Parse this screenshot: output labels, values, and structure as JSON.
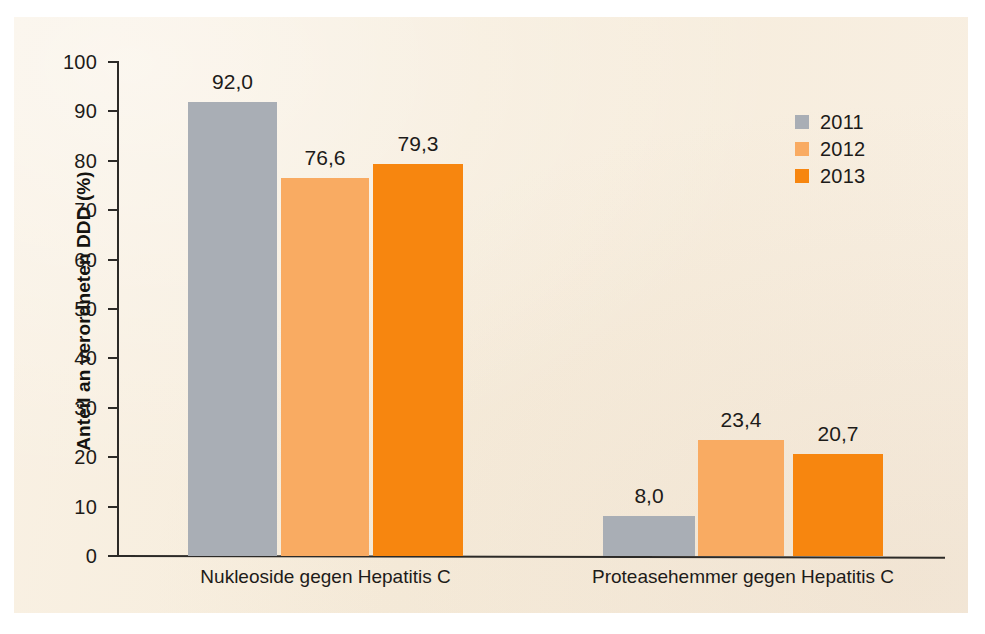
{
  "chart_data": {
    "type": "bar",
    "title": "",
    "xlabel": "",
    "ylabel": "Anteil an verordneten DDD (%)",
    "ylim": [
      0,
      100
    ],
    "ytick_step": 10,
    "yticks": [
      "100",
      "90",
      "80",
      "70",
      "60",
      "50",
      "40",
      "30",
      "20",
      "10",
      "0"
    ],
    "grid": false,
    "legend_position": "top-right",
    "categories": [
      "Nukleoside gegen Hepatitis C",
      "Proteasehemmer gegen Hepatitis C"
    ],
    "series": [
      {
        "name": "2011",
        "color": "#a9aeb5",
        "values": [
          92.0,
          8.0
        ],
        "labels": [
          "92,0",
          "8,0"
        ]
      },
      {
        "name": "2012",
        "color": "#f9ab62",
        "values": [
          76.6,
          23.4
        ],
        "labels": [
          "76,6",
          "23,4"
        ]
      },
      {
        "name": "2013",
        "color": "#f7860f",
        "values": [
          79.3,
          20.7
        ],
        "labels": [
          "79,3",
          "20,7"
        ]
      }
    ]
  },
  "legend": {
    "items": [
      {
        "label": "2011",
        "color": "#a9aeb5"
      },
      {
        "label": "2012",
        "color": "#f9ab62"
      },
      {
        "label": "2013",
        "color": "#f7860f"
      }
    ]
  },
  "axis": {
    "y_title": "Anteil an verordneten DDD (%)",
    "y_labels": [
      "100",
      "90",
      "80",
      "70",
      "60",
      "50",
      "40",
      "30",
      "20",
      "10",
      "0"
    ],
    "x_labels": [
      "Nukleoside gegen Hepatitis C",
      "Proteasehemmer gegen Hepatitis C"
    ]
  },
  "bars": [
    {
      "group": 0,
      "series": "2011",
      "label": "92,0",
      "value": 92.0,
      "color": "#a9aeb5",
      "x": 188,
      "w": 89
    },
    {
      "group": 0,
      "series": "2012",
      "label": "76,6",
      "value": 76.6,
      "color": "#f9ab62",
      "x": 281,
      "w": 88
    },
    {
      "group": 0,
      "series": "2013",
      "label": "79,3",
      "value": 79.3,
      "color": "#f7860f",
      "x": 373,
      "w": 90
    },
    {
      "group": 1,
      "series": "2011",
      "label": "8,0",
      "value": 8.0,
      "color": "#a9aeb5",
      "x": 603,
      "w": 92
    },
    {
      "group": 1,
      "series": "2012",
      "label": "23,4",
      "value": 23.4,
      "color": "#f9ab62",
      "x": 698,
      "w": 86
    },
    {
      "group": 1,
      "series": "2013",
      "label": "20,7",
      "value": 20.7,
      "color": "#f7860f",
      "x": 793,
      "w": 90
    }
  ],
  "colors": {
    "panel_background": "#f7eede",
    "page_background": "#ffffff",
    "axis": "#2c2a27",
    "text": "#1d1b19",
    "series_2011": "#a9aeb5",
    "series_2012": "#f9ab62",
    "series_2013": "#f7860f"
  }
}
